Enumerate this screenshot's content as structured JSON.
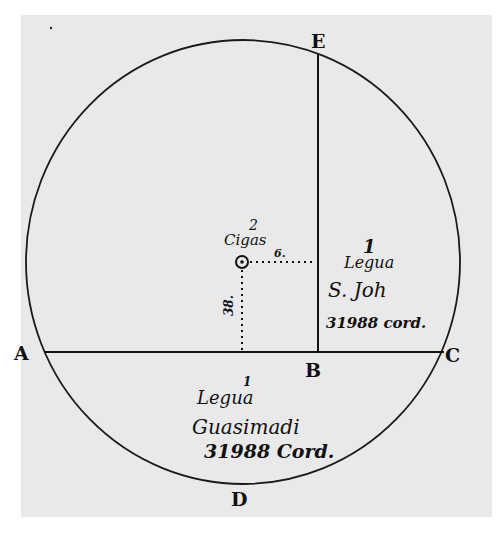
{
  "diagram": {
    "points": {
      "A": "A",
      "B": "B",
      "C": "C",
      "D": "D",
      "E": "E"
    },
    "center_marker": {
      "label": "Cigas",
      "label_superscript": "2"
    },
    "offset_labels": {
      "horizontal": "6.",
      "vertical": "38."
    },
    "right_annotation": {
      "numeral": "1",
      "line1": "Legua",
      "line2": "S. Joh",
      "line3": "31988 cord."
    },
    "bottom_annotation": {
      "numeral": "1",
      "line1": "Legua",
      "line2": "Guasimadi",
      "line3": "31988 Cord."
    },
    "colors": {
      "background": "#ffffff",
      "paper": "#e9e9e9",
      "ink": "#111111"
    }
  }
}
